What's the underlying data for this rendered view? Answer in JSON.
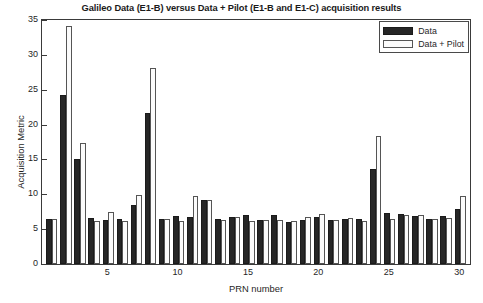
{
  "chart_data": {
    "type": "bar",
    "title": "Galileo Data (E1-B) versus Data + Pilot (E1-B and E1-C) acquisition results",
    "xlabel": "PRN number",
    "ylabel": "Acquisition Metric",
    "xlim": [
      0.3,
      30.7
    ],
    "ylim": [
      0,
      35
    ],
    "yticks": [
      0,
      5,
      10,
      15,
      20,
      25,
      30,
      35
    ],
    "xticks": [
      5,
      10,
      15,
      20,
      25,
      30
    ],
    "grid": false,
    "legend_position": "top-right",
    "categories": [
      1,
      2,
      3,
      4,
      5,
      6,
      7,
      8,
      9,
      10,
      11,
      12,
      13,
      14,
      15,
      16,
      17,
      18,
      19,
      20,
      21,
      22,
      23,
      24,
      25,
      26,
      27,
      28,
      29,
      30
    ],
    "series": [
      {
        "name": "Data",
        "color": "#262626",
        "values": [
          6.5,
          24.2,
          15.0,
          6.6,
          6.3,
          6.4,
          8.5,
          21.6,
          6.5,
          6.9,
          6.8,
          9.2,
          6.4,
          6.7,
          7.0,
          6.3,
          7.1,
          6.0,
          6.3,
          6.7,
          6.3,
          6.5,
          6.5,
          13.6,
          7.3,
          7.2,
          6.9,
          6.5,
          6.9,
          7.9
        ]
      },
      {
        "name": "Data + Pilot",
        "color": "#fbfbfb",
        "values": [
          6.5,
          34.2,
          17.3,
          6.1,
          7.4,
          6.1,
          9.9,
          28.1,
          6.4,
          6.2,
          9.8,
          9.2,
          6.3,
          6.7,
          6.1,
          6.3,
          6.3,
          6.1,
          6.7,
          7.2,
          6.3,
          6.6,
          6.1,
          18.4,
          6.4,
          7.1,
          7.1,
          6.5,
          6.6,
          9.8
        ]
      }
    ]
  },
  "legend": {
    "items": [
      {
        "label": "Data",
        "swatch": "data"
      },
      {
        "label": "Data + Pilot",
        "swatch": "pilot"
      }
    ]
  }
}
